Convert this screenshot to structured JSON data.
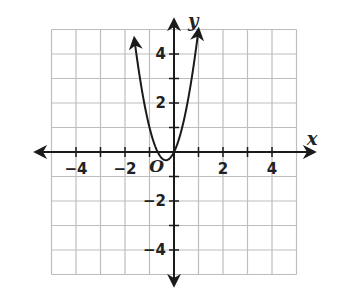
{
  "chart_data": {
    "type": "line",
    "title": "",
    "xlabel": "x",
    "ylabel": "y",
    "xlim": [
      -5,
      5
    ],
    "ylim": [
      -5,
      5
    ],
    "grid": true,
    "x_ticks": [
      -4,
      -2,
      2,
      4
    ],
    "y_ticks": [
      4,
      2,
      -2,
      -4
    ],
    "x_tick_labels": [
      "−4",
      "−2",
      "2",
      "4"
    ],
    "y_tick_labels": [
      "4",
      "2",
      "−2",
      "−4"
    ],
    "origin_label": "O",
    "series": [
      {
        "name": "parabola",
        "equation": "y = 3x^2 + 2x",
        "vertex": [
          -0.33,
          -0.33
        ],
        "x": [
          -1.8,
          -1.5,
          -1.0,
          -0.5,
          -0.33,
          0,
          0.5,
          1.0,
          1.4
        ],
        "y": [
          6.1,
          3.75,
          1.0,
          -0.25,
          -0.33,
          0,
          1.75,
          5.0,
          8.7
        ],
        "arrows_at_ends": true
      }
    ]
  },
  "colors": {
    "grid": "#bdbdbd",
    "axis": "#1a1a1a",
    "curve": "#1a1a1a"
  }
}
